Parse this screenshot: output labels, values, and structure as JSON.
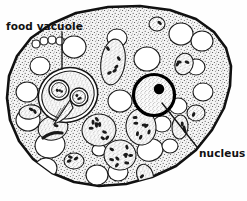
{
  "figure": {
    "kind": "biological-line-drawing",
    "width": 247,
    "height": 201,
    "background_color": "#fefefe",
    "ink_color": "#111111",
    "cytoplasm_fill": "#f2f2f2",
    "stipple_color": "#2a2a2a",
    "vacuole_fill": "#ffffff",
    "nucleus_ring_color": "#000000",
    "nucleolus_color": "#000000"
  },
  "labels": [
    {
      "id": "food-vacuole",
      "text": "food vacuole",
      "x": 6,
      "y": 21,
      "leader": {
        "x1": 62,
        "y1": 32,
        "x2": 62,
        "y2": 69
      }
    },
    {
      "id": "nucleus",
      "text": "nucleus",
      "x": 199,
      "y": 148,
      "leader": {
        "x1": 197,
        "y1": 147,
        "x2": 162,
        "y2": 103
      }
    }
  ],
  "cell": {
    "outline_points": "108,7 140,6 170,10 196,19 214,32 226,48 231,66 230,86 224,108 212,130 196,150 176,166 152,177 126,184 99,186 74,182 52,173 33,159 19,141 10,120 7,98 9,76 17,56 31,38 51,24 76,13",
    "outline_stroke_width": 2.6
  },
  "nucleus": {
    "cx": 154,
    "cy": 95,
    "r": 20.5,
    "ring_width": 3.2,
    "nucleolus": {
      "cx": 159,
      "cy": 89,
      "r": 5.2
    }
  },
  "food_vacuole": {
    "cx": 68,
    "cy": 95,
    "rx": 30,
    "ry": 27,
    "rotation": -20,
    "contents": [
      {
        "type": "engulfed-cell",
        "cx": 59,
        "cy": 90,
        "r": 10
      },
      {
        "type": "engulfed-cell",
        "cx": 79,
        "cy": 97,
        "r": 9
      },
      {
        "type": "engulfed-flagellum",
        "cx": 63,
        "cy": 112
      }
    ]
  },
  "clear_vacuoles": [
    {
      "cx": 74,
      "cy": 47,
      "rx": 12,
      "ry": 11,
      "rot": 0
    },
    {
      "cx": 117,
      "cy": 38,
      "rx": 10,
      "ry": 9,
      "rot": 0
    },
    {
      "cx": 147,
      "cy": 59,
      "rx": 13,
      "ry": 12,
      "rot": 0
    },
    {
      "cx": 181,
      "cy": 34,
      "rx": 12,
      "ry": 11,
      "rot": 0
    },
    {
      "cx": 202,
      "cy": 41,
      "rx": 11,
      "ry": 10,
      "rot": 0
    },
    {
      "cx": 196,
      "cy": 67,
      "rx": 9,
      "ry": 8,
      "rot": 0
    },
    {
      "cx": 203,
      "cy": 92,
      "rx": 10,
      "ry": 9,
      "rot": 0
    },
    {
      "cx": 178,
      "cy": 106,
      "rx": 9,
      "ry": 8,
      "rot": 0
    },
    {
      "cx": 120,
      "cy": 101,
      "rx": 12,
      "ry": 11,
      "rot": 0
    },
    {
      "cx": 40,
      "cy": 66,
      "rx": 10,
      "ry": 9,
      "rot": 0
    },
    {
      "cx": 27,
      "cy": 92,
      "rx": 11,
      "ry": 10,
      "rot": 0
    },
    {
      "cx": 28,
      "cy": 120,
      "rx": 12,
      "ry": 11,
      "rot": 0
    },
    {
      "cx": 50,
      "cy": 145,
      "rx": 15,
      "ry": 13,
      "rot": -10
    },
    {
      "cx": 46,
      "cy": 168,
      "rx": 11,
      "ry": 10,
      "rot": 0
    },
    {
      "cx": 97,
      "cy": 175,
      "rx": 11,
      "ry": 10,
      "rot": 0
    },
    {
      "cx": 118,
      "cy": 172,
      "rx": 10,
      "ry": 9,
      "rot": 0
    },
    {
      "cx": 150,
      "cy": 150,
      "rx": 13,
      "ry": 11,
      "rot": -15
    },
    {
      "cx": 170,
      "cy": 146,
      "rx": 8,
      "ry": 7,
      "rot": 0
    },
    {
      "cx": 162,
      "cy": 124,
      "rx": 9,
      "ry": 8,
      "rot": 0
    },
    {
      "cx": 99,
      "cy": 150,
      "rx": 7,
      "ry": 6,
      "rot": 0
    },
    {
      "cx": 36,
      "cy": 44,
      "rx": 4,
      "ry": 4,
      "rot": 0
    },
    {
      "cx": 44,
      "cy": 41,
      "rx": 4,
      "ry": 4,
      "rot": 0
    },
    {
      "cx": 52,
      "cy": 40,
      "rx": 4,
      "ry": 4,
      "rot": 0
    },
    {
      "cx": 60,
      "cy": 41,
      "rx": 4,
      "ry": 4,
      "rot": 0
    }
  ],
  "bacteria_vacuoles": [
    {
      "cx": 113,
      "cy": 62,
      "rx": 12,
      "ry": 23,
      "rot": 8,
      "granules": 5
    },
    {
      "cx": 99,
      "cy": 130,
      "rx": 17,
      "ry": 16,
      "rot": -10,
      "granules": 9
    },
    {
      "cx": 120,
      "cy": 155,
      "rx": 16,
      "ry": 15,
      "rot": 10,
      "granules": 9
    },
    {
      "cx": 141,
      "cy": 127,
      "rx": 15,
      "ry": 18,
      "rot": -5,
      "granules": 7
    },
    {
      "cx": 184,
      "cy": 64,
      "rx": 9,
      "ry": 11,
      "rot": 20,
      "granules": 3
    },
    {
      "cx": 180,
      "cy": 127,
      "rx": 8,
      "ry": 12,
      "rot": 5,
      "granules": 3
    },
    {
      "cx": 74,
      "cy": 161,
      "rx": 10,
      "ry": 8,
      "rot": 0,
      "granules": 3
    },
    {
      "cx": 30,
      "cy": 112,
      "rx": 11,
      "ry": 7,
      "rot": -8,
      "granules": 2
    },
    {
      "cx": 145,
      "cy": 175,
      "rx": 8,
      "ry": 11,
      "rot": -20,
      "granules": 1
    },
    {
      "cx": 157,
      "cy": 24,
      "rx": 8,
      "ry": 7,
      "rot": 0,
      "granules": 1
    },
    {
      "cx": 196,
      "cy": 113,
      "rx": 9,
      "ry": 8,
      "rot": 0,
      "granules": 1
    },
    {
      "cx": 53,
      "cy": 128,
      "rx": 15,
      "ry": 12,
      "rot": -15,
      "granules": 1
    }
  ]
}
